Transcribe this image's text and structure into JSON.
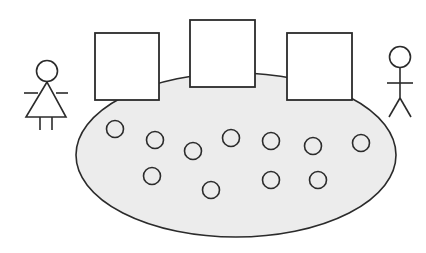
{
  "diagram": {
    "colors": {
      "background": "#ffffff",
      "stroke": "#2b2b2b",
      "ellipse_fill": "#ececec",
      "box_fill": "#ffffff",
      "circle_fill": "none"
    },
    "ellipse": {
      "cx": 236,
      "cy": 155,
      "rx": 160,
      "ry": 82
    },
    "boxes": [
      {
        "x": 95,
        "y": 33,
        "w": 64,
        "h": 67
      },
      {
        "x": 190,
        "y": 20,
        "w": 65,
        "h": 67
      },
      {
        "x": 287,
        "y": 33,
        "w": 65,
        "h": 67
      }
    ],
    "circles": [
      {
        "cx": 115,
        "cy": 129,
        "r": 8.5
      },
      {
        "cx": 155,
        "cy": 140,
        "r": 8.5
      },
      {
        "cx": 193,
        "cy": 151,
        "r": 8.5
      },
      {
        "cx": 231,
        "cy": 138,
        "r": 8.5
      },
      {
        "cx": 271,
        "cy": 141,
        "r": 8.5
      },
      {
        "cx": 313,
        "cy": 146,
        "r": 8.5
      },
      {
        "cx": 361,
        "cy": 143,
        "r": 8.5
      },
      {
        "cx": 152,
        "cy": 176,
        "r": 8.5
      },
      {
        "cx": 211,
        "cy": 190,
        "r": 8.5
      },
      {
        "cx": 271,
        "cy": 180,
        "r": 8.5
      },
      {
        "cx": 318,
        "cy": 180,
        "r": 8.5
      }
    ],
    "figures": [
      {
        "type": "female",
        "label": "female-stick-figure"
      },
      {
        "type": "male",
        "label": "male-stick-figure"
      }
    ]
  }
}
